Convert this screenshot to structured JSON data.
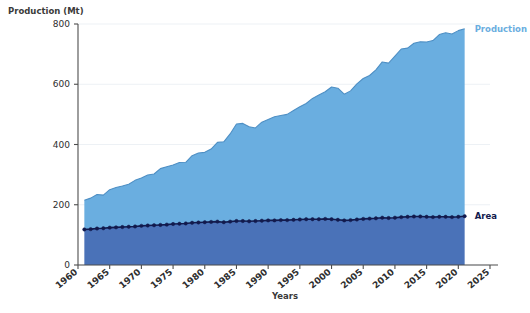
{
  "chart_data": {
    "type": "area",
    "title": "",
    "xlabel": "Years",
    "ylabel": "Production (Mt)",
    "stacked": true,
    "grid": false,
    "legend_position": "right-inline",
    "xlim": [
      1960,
      2025
    ],
    "ylim": [
      0,
      800
    ],
    "yticks": [
      0,
      200,
      400,
      600,
      800
    ],
    "xticks": [
      1960,
      1965,
      1970,
      1975,
      1980,
      1985,
      1990,
      1995,
      2000,
      2005,
      2010,
      2015,
      2020,
      2025
    ],
    "x": [
      1961,
      1962,
      1963,
      1964,
      1965,
      1966,
      1967,
      1968,
      1969,
      1970,
      1971,
      1972,
      1973,
      1974,
      1975,
      1976,
      1977,
      1978,
      1979,
      1980,
      1981,
      1982,
      1983,
      1984,
      1985,
      1986,
      1987,
      1988,
      1989,
      1990,
      1991,
      1992,
      1993,
      1994,
      1995,
      1996,
      1997,
      1998,
      1999,
      2000,
      2001,
      2002,
      2003,
      2004,
      2005,
      2006,
      2007,
      2008,
      2009,
      2010,
      2011,
      2012,
      2013,
      2014,
      2015,
      2016,
      2017,
      2018,
      2019,
      2020,
      2021
    ],
    "series": [
      {
        "name": "Production",
        "color": "#6aaee0",
        "line_color": "#4e8fc4",
        "values": [
          215,
          222,
          234,
          232,
          250,
          257,
          262,
          268,
          281,
          289,
          299,
          302,
          320,
          326,
          332,
          340,
          341,
          363,
          372,
          374,
          385,
          407,
          409,
          435,
          468,
          470,
          459,
          455,
          474,
          483,
          492,
          496,
          500,
          513,
          525,
          536,
          553,
          564,
          575,
          591,
          587,
          567,
          578,
          601,
          619,
          629,
          648,
          674,
          670,
          693,
          717,
          720,
          736,
          741,
          740,
          745,
          765,
          771,
          767,
          778,
          784
        ]
      },
      {
        "name": "Area",
        "color": "#4a72b8",
        "line_color": "#121a4d",
        "marker": "circle",
        "values": [
          118,
          119,
          121,
          122,
          124,
          125,
          126,
          127,
          128,
          130,
          131,
          132,
          133,
          134,
          136,
          137,
          138,
          140,
          141,
          142,
          143,
          144,
          142,
          144,
          146,
          146,
          145,
          146,
          147,
          148,
          148,
          149,
          149,
          150,
          151,
          152,
          152,
          152,
          153,
          152,
          150,
          148,
          149,
          151,
          153,
          154,
          155,
          157,
          156,
          157,
          159,
          160,
          161,
          161,
          160,
          159,
          160,
          160,
          159,
          160,
          162
        ]
      }
    ],
    "annotations": [
      {
        "text": "Production",
        "color": "#6aaee0",
        "at_x": 2021,
        "at_y": 784
      },
      {
        "text": "Area",
        "color": "#121a4d",
        "at_x": 2021,
        "at_y": 162
      }
    ]
  },
  "labels": {
    "ylabel": "Production (Mt)",
    "xlabel": "Years",
    "legend_production": "Production",
    "legend_area": "Area"
  },
  "yticklabels": [
    "0",
    "200",
    "400",
    "600",
    "800"
  ],
  "xticklabels": [
    "1960",
    "1965",
    "1970",
    "1975",
    "1980",
    "1985",
    "1990",
    "1995",
    "2000",
    "2005",
    "2010",
    "2015",
    "2020",
    "2025"
  ]
}
